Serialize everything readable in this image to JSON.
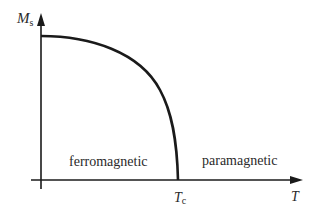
{
  "diagram": {
    "type": "phase-diagram",
    "y_axis": {
      "label": "M",
      "label_sub": "s"
    },
    "x_axis": {
      "label": "T"
    },
    "critical_point": {
      "label": "T",
      "label_sub": "c"
    },
    "regions": [
      {
        "label": "ferromagnetic"
      },
      {
        "label": "paramagnetic"
      }
    ],
    "colors": {
      "line": "#1a1a1a",
      "text": "#2a2a2a",
      "background": "#ffffff"
    }
  }
}
